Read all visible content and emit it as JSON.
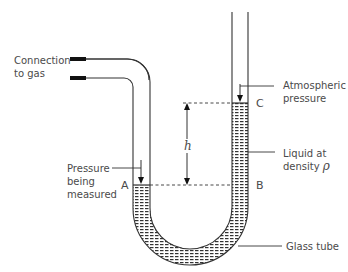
{
  "diagram": {
    "type": "U-tube manometer",
    "labels": {
      "connection_line1": "Connection",
      "connection_line2": "to gas",
      "atmospheric_line1": "Atmospheric",
      "atmospheric_line2": "pressure",
      "pressure_line1": "Pressure",
      "pressure_line2": "being",
      "pressure_line3": "measured",
      "liquid_line1": "Liquid at",
      "liquid_line2": "density ",
      "liquid_symbol": "ρ",
      "glass_tube": "Glass tube",
      "point_a": "A",
      "point_b": "B",
      "point_c": "C",
      "height": "h"
    },
    "colors": {
      "line": "#333333",
      "text": "#4a4a4a",
      "liquid_hatch": "#333333",
      "background": "#ffffff"
    }
  }
}
